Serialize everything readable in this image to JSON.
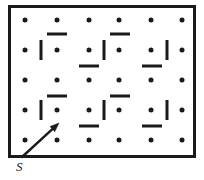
{
  "figure": {
    "name": "maze-grid-with-start-arrow",
    "canvas": {
      "width": 204,
      "height": 180
    },
    "colors": {
      "ink": "#1a1a1a",
      "background": "#ffffff"
    },
    "border": {
      "x": 8,
      "y": 5,
      "width": 188,
      "height": 153,
      "thickness": 3
    },
    "grid": {
      "columns": 6,
      "rows": 5,
      "column_x": [
        25,
        57,
        89,
        119,
        151,
        182
      ],
      "row_y": [
        20,
        50,
        80,
        110,
        140
      ],
      "dot_radius": 2.5
    },
    "dots": [
      {
        "col": 1,
        "row": 1,
        "x": 25,
        "y": 20
      },
      {
        "col": 2,
        "row": 1,
        "x": 57,
        "y": 20
      },
      {
        "col": 3,
        "row": 1,
        "x": 89,
        "y": 20
      },
      {
        "col": 4,
        "row": 1,
        "x": 119,
        "y": 20
      },
      {
        "col": 5,
        "row": 1,
        "x": 151,
        "y": 20
      },
      {
        "col": 6,
        "row": 1,
        "x": 182,
        "y": 20
      },
      {
        "col": 1,
        "row": 2,
        "x": 25,
        "y": 50
      },
      {
        "col": 2,
        "row": 2,
        "x": 57,
        "y": 50
      },
      {
        "col": 3,
        "row": 2,
        "x": 89,
        "y": 50
      },
      {
        "col": 4,
        "row": 2,
        "x": 119,
        "y": 50
      },
      {
        "col": 5,
        "row": 2,
        "x": 151,
        "y": 50
      },
      {
        "col": 6,
        "row": 2,
        "x": 182,
        "y": 50
      },
      {
        "col": 1,
        "row": 3,
        "x": 25,
        "y": 80
      },
      {
        "col": 2,
        "row": 3,
        "x": 57,
        "y": 80
      },
      {
        "col": 3,
        "row": 3,
        "x": 89,
        "y": 80
      },
      {
        "col": 4,
        "row": 3,
        "x": 119,
        "y": 80
      },
      {
        "col": 5,
        "row": 3,
        "x": 151,
        "y": 80
      },
      {
        "col": 6,
        "row": 3,
        "x": 182,
        "y": 80
      },
      {
        "col": 1,
        "row": 4,
        "x": 25,
        "y": 110
      },
      {
        "col": 2,
        "row": 4,
        "x": 57,
        "y": 110
      },
      {
        "col": 3,
        "row": 4,
        "x": 89,
        "y": 110
      },
      {
        "col": 4,
        "row": 4,
        "x": 119,
        "y": 110
      },
      {
        "col": 5,
        "row": 4,
        "x": 151,
        "y": 110
      },
      {
        "col": 6,
        "row": 4,
        "x": 182,
        "y": 110
      },
      {
        "col": 1,
        "row": 5,
        "x": 25,
        "y": 140
      },
      {
        "col": 2,
        "row": 5,
        "x": 57,
        "y": 140
      },
      {
        "col": 3,
        "row": 5,
        "x": 89,
        "y": 140
      },
      {
        "col": 4,
        "row": 5,
        "x": 119,
        "y": 140
      },
      {
        "col": 5,
        "row": 5,
        "x": 151,
        "y": 140
      },
      {
        "col": 6,
        "row": 5,
        "x": 182,
        "y": 140
      }
    ],
    "walls_horizontal": [
      {
        "id": "wall-h-r1r2-c2",
        "x": 57,
        "y": 34,
        "length": 20
      },
      {
        "id": "wall-h-r1r2-c4",
        "x": 120,
        "y": 34,
        "length": 20
      },
      {
        "id": "wall-h-r2r3-c3",
        "x": 89,
        "y": 66,
        "length": 20
      },
      {
        "id": "wall-h-r2r3-c5",
        "x": 152,
        "y": 66,
        "length": 20
      },
      {
        "id": "wall-h-r3r4-c2",
        "x": 57,
        "y": 96,
        "length": 20
      },
      {
        "id": "wall-h-r3r4-c4",
        "x": 120,
        "y": 96,
        "length": 20
      },
      {
        "id": "wall-h-r4r5-c3",
        "x": 89,
        "y": 126,
        "length": 20
      },
      {
        "id": "wall-h-r4r5-c5",
        "x": 152,
        "y": 126,
        "length": 20
      }
    ],
    "walls_vertical": [
      {
        "id": "wall-v-c1c2-r2",
        "x": 41,
        "y": 50,
        "length": 20
      },
      {
        "id": "wall-v-c3c4-r2",
        "x": 104,
        "y": 50,
        "length": 20
      },
      {
        "id": "wall-v-c5c6-r2",
        "x": 167,
        "y": 50,
        "length": 20
      },
      {
        "id": "wall-v-c1c2-r4",
        "x": 41,
        "y": 110,
        "length": 20
      },
      {
        "id": "wall-v-c3c4-r4",
        "x": 104,
        "y": 110,
        "length": 20
      },
      {
        "id": "wall-v-c5c6-r4",
        "x": 167,
        "y": 110,
        "length": 20
      }
    ],
    "start_arrow": {
      "name": "start-direction-arrow",
      "from_x": 22,
      "from_y": 157,
      "to_x": 59,
      "to_y": 123,
      "stroke_width": 2.4,
      "head_length": 9,
      "head_width": 7
    },
    "start_label": {
      "text": "S",
      "x": 16,
      "y": 160
    }
  }
}
